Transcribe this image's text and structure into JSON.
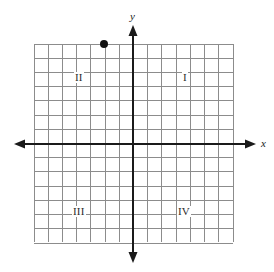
{
  "figure": {
    "width": 274,
    "height": 272,
    "background_color": "#ffffff"
  },
  "axes": {
    "x_label": "x",
    "y_label": "y",
    "x_axis_y_px": 144,
    "y_axis_x_px": 133,
    "color": "#1a1a1a",
    "stroke_width": 2,
    "arrowheads": [
      "left",
      "right",
      "up",
      "down"
    ],
    "x_arrow_left_px": 14,
    "x_arrow_right_px": 256,
    "y_arrow_top_px": 25,
    "y_arrow_bottom_px": 263
  },
  "grid": {
    "color": "#8c8c8c",
    "stroke_width": 1,
    "left_px": 34,
    "top_px": 44,
    "right_px": 233,
    "bottom_px": 242,
    "cell_size_px": 14.214,
    "columns": 14,
    "rows": 14,
    "x_min": -7,
    "x_max": 7,
    "y_min": -7,
    "y_max": 7
  },
  "quadrants": [
    {
      "name": "quadrant-1",
      "label": "I"
    },
    {
      "name": "quadrant-2",
      "label": "II"
    },
    {
      "name": "quadrant-3",
      "label": "III"
    },
    {
      "name": "quadrant-4",
      "label": "IV"
    }
  ],
  "points": [
    {
      "name": "plotted-point",
      "x": -2,
      "y": 7,
      "px_x": 104,
      "px_y": 44,
      "radius_px": 4,
      "color": "#111111"
    }
  ],
  "chart_data": {
    "type": "scatter",
    "title": "",
    "xlabel": "x",
    "ylabel": "y",
    "xlim": [
      -7,
      7
    ],
    "ylim": [
      -7,
      7
    ],
    "grid": true,
    "legend": "none",
    "tick_labels_shown": false,
    "x": [
      -2
    ],
    "y": [
      7
    ],
    "annotations": [
      "I",
      "II",
      "III",
      "IV"
    ]
  }
}
